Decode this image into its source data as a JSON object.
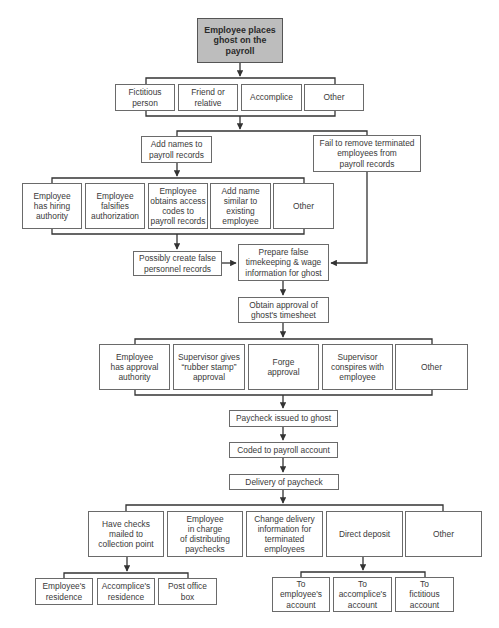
{
  "diagram": {
    "root": "Employee places\nghost on the\npayroll",
    "ghost_identity": [
      "Fictitious\nperson",
      "Friend or\nrelative",
      "Accomplice",
      "Other"
    ],
    "add_names": "Add names to\npayroll records",
    "fail_remove": "Fail to remove terminated\nemployees from\npayroll records",
    "add_methods": [
      "Employee\nhas hiring\nauthority",
      "Employee\nfalsifies\nauthorization",
      "Employee\nobtains access\ncodes to\npayroll records",
      "Add name\nsimilar to\nexisting\nemployee",
      "Other"
    ],
    "possibly_create": "Possibly create false\npersonnel records",
    "prepare_false": "Prepare false\ntimekeeping & wage\ninformation for ghost",
    "obtain_approval": "Obtain approval of\nghost's timesheet",
    "approval_methods": [
      "Employee\nhas approval\nauthority",
      "Supervisor gives\n“rubber stamp”\napproval",
      "Forge\napproval",
      "Supervisor\nconspires with\nemployee",
      "Other"
    ],
    "paycheck_issued": "Paycheck issued to ghost",
    "coded": "Coded to payroll account",
    "delivery": "Delivery of paycheck",
    "delivery_methods": [
      "Have checks\nmailed to\ncollection point",
      "Employee\nin charge\nof distributing\npaychecks",
      "Change delivery\ninformation for\nterminated\nemployees",
      "Direct deposit",
      "Other"
    ],
    "collection_points": [
      "Employee's\nresidence",
      "Accomplice's\nresidence",
      "Post office\nbox"
    ],
    "deposit_targets": [
      "To\nemployee's\naccount",
      "To\naccomplice's\naccount",
      "To\nfictitious\naccount"
    ]
  },
  "colors": {
    "root_fill": "#bdbdbd",
    "line": "#333333",
    "border": "#6a6a6a",
    "text": "#3a3a3a"
  }
}
